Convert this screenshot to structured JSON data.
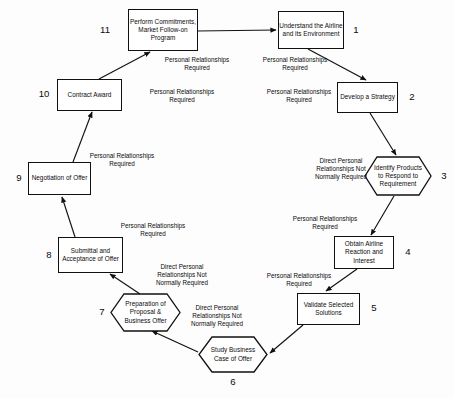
{
  "diagram": {
    "type": "cyclic-flow-diagram",
    "stroke_color": "#111111",
    "background_color": "#fdfdfd",
    "text_color": "#0b0b0b",
    "nodes": [
      {
        "id": 1,
        "number": "1",
        "shape": "rectangle",
        "label": "Understand the Airline and its Environment"
      },
      {
        "id": 2,
        "number": "2",
        "shape": "rectangle",
        "label": "Develop a Strategy"
      },
      {
        "id": 3,
        "number": "3",
        "shape": "hexagon",
        "label": "Identify Products to Respond to Requirement"
      },
      {
        "id": 4,
        "number": "4",
        "shape": "rectangle",
        "label": "Obtain Airline Reaction and Interest"
      },
      {
        "id": 5,
        "number": "5",
        "shape": "rectangle",
        "label": "Validate Selected Solutions"
      },
      {
        "id": 6,
        "number": "6",
        "shape": "hexagon",
        "label": "Study Business Case of Offer"
      },
      {
        "id": 7,
        "number": "7",
        "shape": "hexagon",
        "label": "Preparation of Proposal & Business Offer"
      },
      {
        "id": 8,
        "number": "8",
        "shape": "rectangle",
        "label": "Submittal and Acceptance of Offer"
      },
      {
        "id": 9,
        "number": "9",
        "shape": "rectangle",
        "label": "Negotiation of Offer"
      },
      {
        "id": 10,
        "number": "10",
        "shape": "rectangle",
        "label": "Contract Award"
      },
      {
        "id": 11,
        "number": "11",
        "shape": "rectangle",
        "label": "Perform Commitments, Market Follow-on Program"
      }
    ],
    "edge_labels": [
      {
        "id": "e1_2",
        "from": 1,
        "to": 2,
        "text": "Personal Relationships\nRequired"
      },
      {
        "id": "e1_2b",
        "from": 1,
        "to": 2,
        "text": "Personal Relationships\nRequired"
      },
      {
        "id": "e2_3",
        "from": 2,
        "to": 3,
        "text": "Direct Personal\nRelationships Not\nNormally Required"
      },
      {
        "id": "e3_4",
        "from": 3,
        "to": 4,
        "text": "Personal Relationships\nRequired"
      },
      {
        "id": "e4_5",
        "from": 4,
        "to": 5,
        "text": "Personal Relationships\nRequired"
      },
      {
        "id": "e5_6",
        "from": 5,
        "to": 6,
        "text": "Direct Personal\nRelationships Not\nNormally Required"
      },
      {
        "id": "e6_7",
        "from": 6,
        "to": 7,
        "text": "Direct Personal\nRelationships Not\nNormally Required"
      },
      {
        "id": "e7_8",
        "from": 7,
        "to": 8,
        "text": "Personal Relationships\nRequired"
      },
      {
        "id": "e8_9",
        "from": 8,
        "to": 9,
        "text": "Personal Relationships\nRequired"
      },
      {
        "id": "e9_10",
        "from": 9,
        "to": 10,
        "text": "Personal Relationships\nRequired"
      },
      {
        "id": "e10_11",
        "from": 10,
        "to": 11,
        "text": "Personal Relationships\nRequired"
      },
      {
        "id": "e11_1",
        "from": 11,
        "to": 1,
        "text": "Personal Relationships\nRequired"
      }
    ]
  }
}
